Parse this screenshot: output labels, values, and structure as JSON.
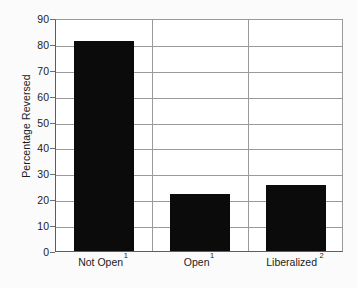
{
  "chart_data": {
    "type": "bar",
    "title": "",
    "subtitle": "",
    "xlabel": "",
    "ylabel": "Percentage Reversed",
    "categories": [
      "Not Open",
      "Open",
      "Liberalized"
    ],
    "category_footnotes": [
      "1",
      "1",
      "2"
    ],
    "values": [
      81,
      22,
      25.5
    ],
    "ylim": [
      0,
      90
    ],
    "ytick_step": 10,
    "yticks": [
      0,
      10,
      20,
      30,
      40,
      50,
      60,
      70,
      80,
      90
    ],
    "ytick_labels": [
      "0",
      "10",
      "20",
      "30",
      "40",
      "50",
      "60",
      "70",
      "80",
      "90"
    ],
    "grid": "horizontal-and-category-separators",
    "legend": "none",
    "bar_color": "#0b0b0b",
    "gridline_color": "#9a9a9a",
    "axis_color": "#5d5d5d",
    "background_color": "#ffffff",
    "text_color": "#1b1b1b"
  },
  "axis": {
    "y_title": "Percentage Reversed"
  },
  "bars": [
    {
      "label": "Not Open",
      "footnote": "1",
      "value": 81
    },
    {
      "label": "Open",
      "footnote": "1",
      "value": 22
    },
    {
      "label": "Liberalized",
      "footnote": "2",
      "value": 25.5
    }
  ]
}
